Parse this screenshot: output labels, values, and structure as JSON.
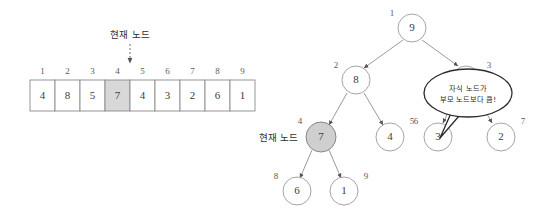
{
  "figure": {
    "background": "#ffffff",
    "highlight_color": "#d8d8d8",
    "node_highlight_color": "#cfcfcf",
    "stroke_color": "#8e8e8e"
  },
  "array_panel": {
    "current_node_label": "현재 노드",
    "indices": [
      "1",
      "2",
      "3",
      "4",
      "5",
      "6",
      "7",
      "8",
      "9"
    ],
    "values": [
      "4",
      "8",
      "5",
      "7",
      "4",
      "3",
      "2",
      "6",
      "1"
    ],
    "highlighted_index": "4"
  },
  "tree_panel": {
    "current_node_label": "현재 노드",
    "nodes": [
      {
        "index": "1",
        "value": "9",
        "idx_pos": "left"
      },
      {
        "index": "2",
        "value": "8",
        "idx_pos": "left"
      },
      {
        "index": "3",
        "value": "",
        "idx_pos": "right"
      },
      {
        "index": "4",
        "value": "7",
        "idx_pos": "left"
      },
      {
        "index": "5",
        "value": "4",
        "idx_pos": "right"
      },
      {
        "index": "6",
        "value": "3",
        "idx_pos": "left"
      },
      {
        "index": "7",
        "value": "2",
        "idx_pos": "right"
      },
      {
        "index": "8",
        "value": "6",
        "idx_pos": "left"
      },
      {
        "index": "9",
        "value": "1",
        "idx_pos": "right"
      }
    ],
    "callout": {
      "line1": "자식 노드가",
      "line2": "부모 노드보다 큼!"
    }
  }
}
